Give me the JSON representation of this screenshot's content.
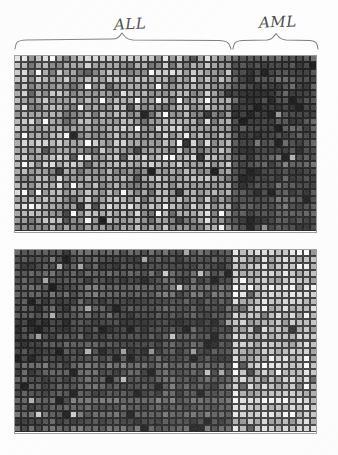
{
  "figure": {
    "background_color": "#fdfdfd",
    "width": 338,
    "height": 455
  },
  "class_labels": {
    "left": "ALL",
    "right": "AML",
    "text_color": "#4a4a4a",
    "brace_color": "#7d7d7d"
  },
  "colormap": {
    "type": "grayscale",
    "low_color": "#1a1a1a",
    "high_color": "#fafafa",
    "cell_border_color": "#2b2b2b"
  },
  "chart_data": {
    "type": "heatmap",
    "subtitle": "",
    "xlabel": "",
    "ylabel": "",
    "grid": true,
    "legend_position": "none",
    "colorscale": "grayscale",
    "value_range": [
      0,
      1
    ],
    "columns": 43,
    "column_groups": [
      {
        "name": "ALL",
        "start": 0,
        "end": 30,
        "count": 31
      },
      {
        "name": "AML",
        "start": 31,
        "end": 42,
        "count": 12
      }
    ],
    "panels": [
      {
        "name": "ALL-high genes",
        "rows": 25,
        "cols": 43,
        "description": "Upper matrix: genes more highly expressed in ALL samples; left (ALL) block is bright/variable, right (AML) block is dark.",
        "region_means": {
          "ALL": 0.62,
          "AML": 0.21
        },
        "region_spread": {
          "ALL": 0.3,
          "AML": 0.17
        },
        "seed": 20377
      },
      {
        "name": "AML-high genes",
        "rows": 26,
        "cols": 43,
        "description": "Lower matrix: genes more highly expressed in AML samples; left (ALL) block is dark, right (AML) block is bright.",
        "region_means": {
          "ALL": 0.26,
          "AML": 0.76
        },
        "region_spread": {
          "ALL": 0.17,
          "AML": 0.26
        },
        "seed": 91145
      }
    ],
    "cell_size_px": 7.05,
    "annotations": [
      {
        "text": "ALL",
        "target": "columns 0-30",
        "style": "handwritten brace above"
      },
      {
        "text": "AML",
        "target": "columns 31-42",
        "style": "handwritten brace above"
      }
    ]
  }
}
